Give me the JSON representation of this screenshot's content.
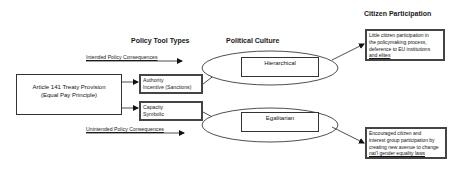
{
  "headers": {
    "policy_tool_types": "Policy Tool Types",
    "political_culture": "Political Culture",
    "citizen_participation": "Citizen Participation"
  },
  "consequences": {
    "intended": "Intended Policy Consequences",
    "unintended": "Unintended Policy Consequences"
  },
  "source": {
    "line1": "Article 141 Treaty Provision",
    "line2": "(Equal Pay Principle)"
  },
  "tools": [
    {
      "line1": "Authority",
      "line2": "Incentive (Sanctions)"
    },
    {
      "line1": "Capacity",
      "line2": "Symbolic"
    }
  ],
  "cultures": [
    {
      "label": "Hierarchical"
    },
    {
      "label": "Egalitarian"
    }
  ],
  "outcomes": [
    {
      "lines": [
        "Little citizen participation in",
        "the policymaking process,",
        "deference to EU institutions",
        "and elites"
      ]
    },
    {
      "lines": [
        "Encouraged citizen and",
        "interest group participation by",
        "creating new avenue to change",
        "nat'l gender equality laws"
      ]
    }
  ]
}
